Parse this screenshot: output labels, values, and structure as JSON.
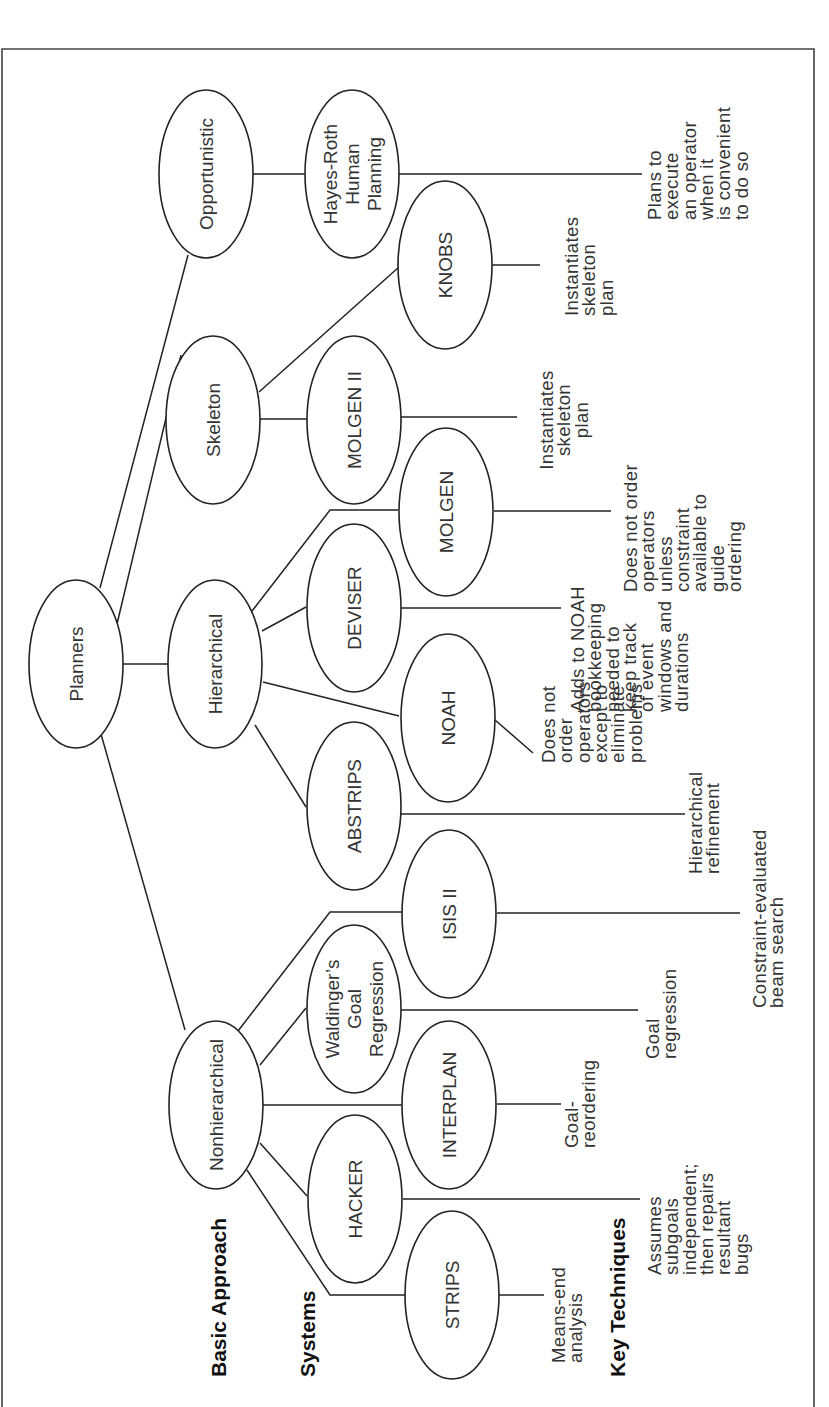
{
  "row_labels": {
    "basic_approach": "Basic Approach",
    "systems": "Systems",
    "key_techniques": "Key Techniques"
  },
  "nodes": {
    "planners": {
      "lines": [
        "Planners"
      ]
    },
    "opportunistic": {
      "lines": [
        "Opportunistic"
      ]
    },
    "skeleton": {
      "lines": [
        "Skeleton"
      ]
    },
    "hierarchical": {
      "lines": [
        "Hierarchical"
      ]
    },
    "nonhierarchical": {
      "lines": [
        "Nonhierarchical"
      ]
    },
    "hayes_roth": {
      "lines": [
        "Hayes-Roth",
        "Human",
        "Planning"
      ]
    },
    "knobs": {
      "lines": [
        "KNOBS"
      ]
    },
    "molgen_ii": {
      "lines": [
        "MOLGEN II"
      ]
    },
    "molgen": {
      "lines": [
        "MOLGEN"
      ]
    },
    "deviser": {
      "lines": [
        "DEVISER"
      ]
    },
    "noah": {
      "lines": [
        "NOAH"
      ]
    },
    "abstrips": {
      "lines": [
        "ABSTRIPS"
      ]
    },
    "isis_ii": {
      "lines": [
        "ISIS II"
      ]
    },
    "waldinger": {
      "lines": [
        "Waldinger’s",
        "Goal",
        "Regression"
      ]
    },
    "interplan": {
      "lines": [
        "INTERPLAN"
      ]
    },
    "hacker": {
      "lines": [
        "HACKER"
      ]
    },
    "strips": {
      "lines": [
        "STRIPS"
      ]
    }
  },
  "techniques": {
    "hayes_roth": [
      "Plans to",
      "execute",
      "an operator",
      "when it",
      "is convenient",
      "to do so"
    ],
    "knobs": [
      "Instantiates",
      "skeleton",
      "plan"
    ],
    "molgen_ii": [
      "Instantiates",
      "skeleton",
      "plan"
    ],
    "molgen": [
      "Does not order",
      "operators",
      "unless",
      "constraint",
      "available to",
      "guide",
      "ordering"
    ],
    "deviser": [
      "Adds to NOAH",
      "bookkeeping",
      "needed to",
      "keep track",
      "of event",
      "windows and",
      "durations"
    ],
    "noah": [
      "Does not",
      "order",
      "operators",
      "except to",
      "eliminate",
      "problems"
    ],
    "abstrips": [
      "Hierarchical",
      "refinement"
    ],
    "isis_ii": [
      "Constraint-evaluated",
      "beam search"
    ],
    "waldinger": [
      "Goal",
      "regression"
    ],
    "interplan": [
      "Goal-",
      "reordering"
    ],
    "hacker": [
      "Assumes",
      "subgoals",
      "independent;",
      "then repairs",
      "resultant",
      "bugs"
    ],
    "strips": [
      "Means-end",
      "analysis"
    ]
  },
  "colors": {
    "stroke": "#222222",
    "text": "#333333",
    "background": "#ffffff"
  }
}
